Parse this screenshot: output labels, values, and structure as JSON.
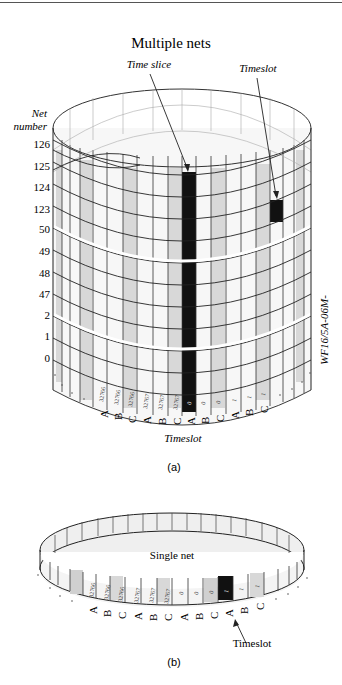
{
  "figure_a": {
    "title": "Multiple nets",
    "callout_time_slice": "Time slice",
    "callout_timeslot": "Timeslot",
    "axis_label_line1": "Net",
    "axis_label_line2": "number",
    "net_numbers": [
      "126",
      "125",
      "124",
      "123",
      "50",
      "49",
      "48",
      "47",
      "2",
      "1",
      "0"
    ],
    "timeslot_sets": [
      "A",
      "B",
      "C",
      "A",
      "B",
      "C",
      "A",
      "B",
      "C",
      "A",
      "B",
      "C"
    ],
    "timeslot_numbers": [
      "32766",
      "32766",
      "32766",
      "32767",
      "32767",
      "32767",
      "0",
      "0",
      "0",
      "1",
      "1",
      "1"
    ],
    "x_axis_label": "Timeslot",
    "side_code": "WF16/5A-06M-",
    "caption": "(a)"
  },
  "figure_b": {
    "center_label": "Single net",
    "timeslot_sets": [
      "A",
      "B",
      "C",
      "A",
      "B",
      "C",
      "A",
      "B",
      "C",
      "A",
      "B",
      "C"
    ],
    "timeslot_numbers": [
      "32766",
      "32766",
      "32766",
      "32767",
      "32767",
      "32767",
      "0",
      "0",
      "0",
      "1",
      "1",
      "1"
    ],
    "highlight_index": 9,
    "callout_timeslot": "Timeslot",
    "caption": "(b)"
  },
  "colors": {
    "line": "#222222",
    "shade_light": "#f2f2f2",
    "shade_mid": "#d4d4d4",
    "highlight": "#111111",
    "break_line": "#ffffff"
  }
}
